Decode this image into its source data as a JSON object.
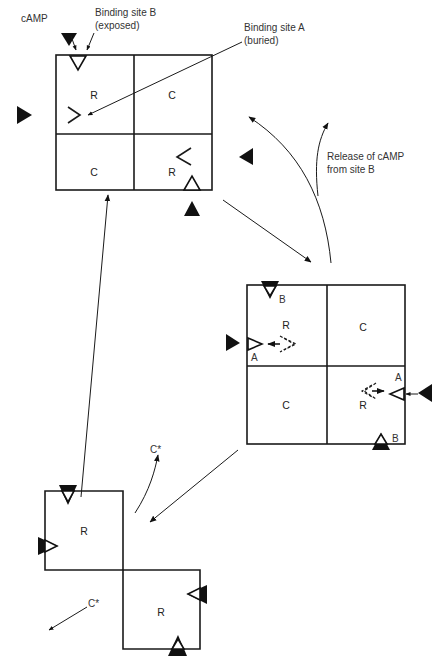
{
  "diagram": {
    "type": "protein kinase A activation cycle",
    "labels": {
      "camp": "cAMP",
      "site_b_line1": "Binding site B",
      "site_b_line2": "(exposed)",
      "site_a_line1": "Binding site A",
      "site_a_line2": "(buried)",
      "release_line1": "Release of cAMP",
      "release_line2": "from site B"
    },
    "state1": {
      "subunits": [
        {
          "label": "R"
        },
        {
          "label": "C"
        },
        {
          "label": "C"
        },
        {
          "label": "R"
        }
      ]
    },
    "state2": {
      "subunits": [
        {
          "label": "R"
        },
        {
          "label": "C"
        },
        {
          "label": "C"
        },
        {
          "label": "R"
        }
      ],
      "site_labels": [
        "B",
        "A",
        "A",
        "B"
      ]
    },
    "state3": {
      "subunits": [
        {
          "label": "R"
        },
        {
          "label": "R"
        }
      ],
      "released": [
        "C*",
        "C*"
      ]
    }
  }
}
